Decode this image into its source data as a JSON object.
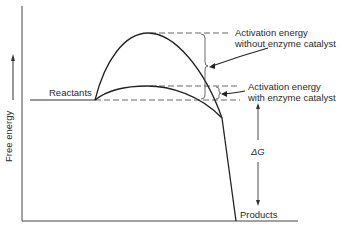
{
  "diagram": {
    "type": "energy-profile",
    "y_axis_label": "Free energy",
    "reactants_label": "Reactants",
    "products_label": "Products",
    "delta_g_label": "ΔG",
    "annotation_uncatalyzed_line1": "Activation energy",
    "annotation_uncatalyzed_line2": "without enzyme catalyst",
    "annotation_catalyzed_line1": "Activation energy",
    "annotation_catalyzed_line2": "with enzyme catalyst",
    "colors": {
      "line": "#2a2a2a",
      "background": "#ffffff"
    }
  }
}
